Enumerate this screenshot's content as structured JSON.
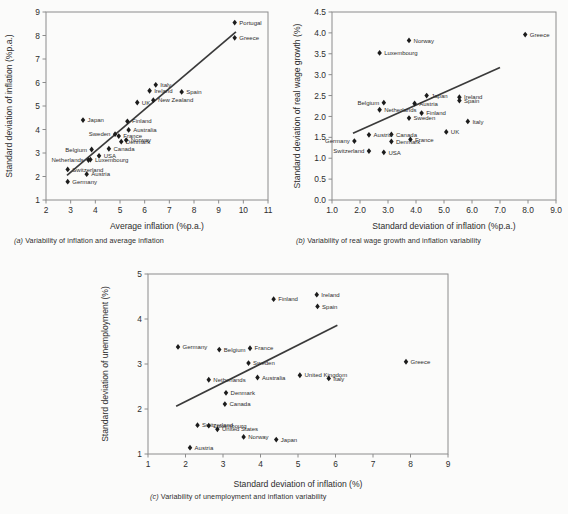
{
  "page": {
    "background": "#fbfbfa",
    "ink": "#2d2d2d",
    "marker_color": "#1c1c1c",
    "line_color": "#3a3a3a",
    "frame_color": "#8c8c8c"
  },
  "captions": {
    "a": "(a) Variability of inflation and average inflation",
    "b": "(b) Variability of real wage growth and inflation variability",
    "c": "(c) Variability of unemployment and inflation variability"
  },
  "chart_data": [
    {
      "id": "a",
      "type": "scatter",
      "title": "",
      "caption": "(a) Variability of inflation and average inflation",
      "xlabel": "Average inflation (%p.a.)",
      "ylabel": "Standard deviation of inflation (%p.a.)",
      "xlim": [
        2,
        11
      ],
      "ylim": [
        1,
        9
      ],
      "xticks": [
        2,
        3,
        4,
        5,
        6,
        7,
        8,
        9,
        10,
        11
      ],
      "yticks": [
        1,
        2,
        3,
        4,
        5,
        6,
        7,
        8,
        9
      ],
      "grid": false,
      "legend": "none",
      "trendline": {
        "x1": 2.85,
        "y1": 2.05,
        "x2": 9.7,
        "y2": 8.15
      },
      "points": [
        {
          "label": "Portugal",
          "x": 9.65,
          "y": 8.55,
          "lpos": "right"
        },
        {
          "label": "Greece",
          "x": 9.65,
          "y": 7.9,
          "lpos": "right"
        },
        {
          "label": "Italy",
          "x": 6.45,
          "y": 5.9,
          "lpos": "right"
        },
        {
          "label": "Ireland",
          "x": 6.2,
          "y": 5.65,
          "lpos": "right"
        },
        {
          "label": "Spain",
          "x": 7.5,
          "y": 5.6,
          "lpos": "right"
        },
        {
          "label": "New Zealand",
          "x": 6.35,
          "y": 5.25,
          "lpos": "right"
        },
        {
          "label": "UK",
          "x": 5.7,
          "y": 5.15,
          "lpos": "right"
        },
        {
          "label": "Japan",
          "x": 3.5,
          "y": 4.4,
          "lpos": "right"
        },
        {
          "label": "Finland",
          "x": 5.3,
          "y": 4.35,
          "lpos": "right"
        },
        {
          "label": "Australia",
          "x": 5.35,
          "y": 3.98,
          "lpos": "right"
        },
        {
          "label": "Sweden",
          "x": 4.8,
          "y": 3.8,
          "lpos": "left"
        },
        {
          "label": "France",
          "x": 4.95,
          "y": 3.72,
          "lpos": "right"
        },
        {
          "label": "Norway",
          "x": 5.25,
          "y": 3.55,
          "lpos": "right"
        },
        {
          "label": "Denmark",
          "x": 5.05,
          "y": 3.48,
          "lpos": "right"
        },
        {
          "label": "Canada",
          "x": 4.55,
          "y": 3.18,
          "lpos": "right"
        },
        {
          "label": "Belgium",
          "x": 3.85,
          "y": 3.15,
          "lpos": "left"
        },
        {
          "label": "USA",
          "x": 4.15,
          "y": 2.88,
          "lpos": "right"
        },
        {
          "label": "Luxembourg",
          "x": 3.8,
          "y": 2.72,
          "lpos": "right"
        },
        {
          "label": "Netherlands",
          "x": 3.72,
          "y": 2.7,
          "lpos": "left"
        },
        {
          "label": "Switzerland",
          "x": 2.88,
          "y": 2.3,
          "lpos": "right"
        },
        {
          "label": "Austria",
          "x": 3.65,
          "y": 2.1,
          "lpos": "right"
        },
        {
          "label": "Germany",
          "x": 2.88,
          "y": 1.78,
          "lpos": "right"
        }
      ]
    },
    {
      "id": "b",
      "type": "scatter",
      "title": "",
      "caption": "(b) Variability of real wage growth and inflation variability",
      "xlabel": "Standard deviation of inflation (%p.a.)",
      "ylabel": "Standard deviation of real wage growth (%)",
      "xlim": [
        1.0,
        9.0
      ],
      "ylim": [
        0.0,
        4.5
      ],
      "xticks": [
        "1.0",
        "2.0",
        "3.0",
        "4.0",
        "5.0",
        "6.0",
        "7.0",
        "8.0",
        "9.0"
      ],
      "yticks": [
        "0.0",
        "0.5",
        "1.0",
        "1.5",
        "2.0",
        "2.5",
        "3.0",
        "3.5",
        "4.0",
        "4.5"
      ],
      "grid": false,
      "legend": "none",
      "trendline": {
        "x1": 1.75,
        "y1": 1.6,
        "x2": 7.0,
        "y2": 3.17
      },
      "points": [
        {
          "label": "Greece",
          "x": 7.9,
          "y": 3.96,
          "lpos": "right"
        },
        {
          "label": "Norway",
          "x": 3.75,
          "y": 3.82,
          "lpos": "right"
        },
        {
          "label": "Luxembourg",
          "x": 2.7,
          "y": 3.52,
          "lpos": "right"
        },
        {
          "label": "Japan",
          "x": 4.38,
          "y": 2.5,
          "lpos": "right"
        },
        {
          "label": "Ireland",
          "x": 5.55,
          "y": 2.46,
          "lpos": "right"
        },
        {
          "label": "Spain",
          "x": 5.55,
          "y": 2.38,
          "lpos": "right"
        },
        {
          "label": "Belgium",
          "x": 2.85,
          "y": 2.33,
          "lpos": "left"
        },
        {
          "label": "Austria",
          "x": 3.95,
          "y": 2.31,
          "lpos": "right"
        },
        {
          "label": "Netherlands",
          "x": 2.7,
          "y": 2.16,
          "lpos": "right"
        },
        {
          "label": "Finland",
          "x": 4.2,
          "y": 2.08,
          "lpos": "right"
        },
        {
          "label": "Sweden",
          "x": 3.75,
          "y": 1.96,
          "lpos": "right"
        },
        {
          "label": "Italy",
          "x": 5.85,
          "y": 1.88,
          "lpos": "right"
        },
        {
          "label": "UK",
          "x": 5.08,
          "y": 1.63,
          "lpos": "right"
        },
        {
          "label": "Canada",
          "x": 3.12,
          "y": 1.57,
          "lpos": "right"
        },
        {
          "label": "Austria2",
          "x": 2.32,
          "y": 1.56,
          "lpos": "right"
        },
        {
          "label": "France",
          "x": 3.8,
          "y": 1.45,
          "lpos": "right"
        },
        {
          "label": "Germany",
          "x": 1.8,
          "y": 1.41,
          "lpos": "left"
        },
        {
          "label": "Denmark",
          "x": 3.12,
          "y": 1.4,
          "lpos": "right"
        },
        {
          "label": "Switzerland",
          "x": 2.32,
          "y": 1.17,
          "lpos": "left"
        },
        {
          "label": "USA",
          "x": 2.85,
          "y": 1.14,
          "lpos": "right"
        }
      ],
      "label_overrides": {
        "Austria2": "Austria"
      }
    },
    {
      "id": "c",
      "type": "scatter",
      "title": "",
      "caption": "(c) Variability of unemployment and inflation variability",
      "xlabel": "Standard deviation of inflation (%)",
      "ylabel": "Standard deviation of unemployment (%)",
      "xlim": [
        1,
        9
      ],
      "ylim": [
        1,
        5
      ],
      "xticks": [
        1,
        2,
        3,
        4,
        5,
        6,
        7,
        8,
        9
      ],
      "yticks": [
        1,
        2,
        3,
        4,
        5
      ],
      "grid": false,
      "legend": "none",
      "trendline": {
        "x1": 1.75,
        "y1": 2.06,
        "x2": 6.05,
        "y2": 3.86
      },
      "points": [
        {
          "label": "Ireland",
          "x": 5.5,
          "y": 4.54,
          "lpos": "right"
        },
        {
          "label": "Finland",
          "x": 4.35,
          "y": 4.44,
          "lpos": "right"
        },
        {
          "label": "Spain",
          "x": 5.52,
          "y": 4.28,
          "lpos": "right"
        },
        {
          "label": "Germany",
          "x": 1.8,
          "y": 3.38,
          "lpos": "right"
        },
        {
          "label": "France",
          "x": 3.72,
          "y": 3.35,
          "lpos": "right"
        },
        {
          "label": "Belgium",
          "x": 2.9,
          "y": 3.32,
          "lpos": "right"
        },
        {
          "label": "Greece",
          "x": 7.88,
          "y": 3.05,
          "lpos": "right"
        },
        {
          "label": "Sweden",
          "x": 3.68,
          "y": 3.02,
          "lpos": "right"
        },
        {
          "label": "United Kingdom",
          "x": 5.05,
          "y": 2.75,
          "lpos": "right"
        },
        {
          "label": "Australia",
          "x": 3.92,
          "y": 2.7,
          "lpos": "right"
        },
        {
          "label": "Italy",
          "x": 5.82,
          "y": 2.68,
          "lpos": "right"
        },
        {
          "label": "Netherlands",
          "x": 2.62,
          "y": 2.65,
          "lpos": "right"
        },
        {
          "label": "Denmark",
          "x": 3.08,
          "y": 2.36,
          "lpos": "right"
        },
        {
          "label": "Canada",
          "x": 3.05,
          "y": 2.11,
          "lpos": "right"
        },
        {
          "label": "Switzerland",
          "x": 2.32,
          "y": 1.64,
          "lpos": "right"
        },
        {
          "label": "Luxembourg",
          "x": 2.62,
          "y": 1.63,
          "lpos": "right"
        },
        {
          "label": "United States",
          "x": 2.85,
          "y": 1.55,
          "lpos": "right"
        },
        {
          "label": "Norway",
          "x": 3.55,
          "y": 1.38,
          "lpos": "right"
        },
        {
          "label": "Japan",
          "x": 4.42,
          "y": 1.32,
          "lpos": "right"
        },
        {
          "label": "Austria",
          "x": 2.12,
          "y": 1.14,
          "lpos": "right"
        }
      ]
    }
  ]
}
